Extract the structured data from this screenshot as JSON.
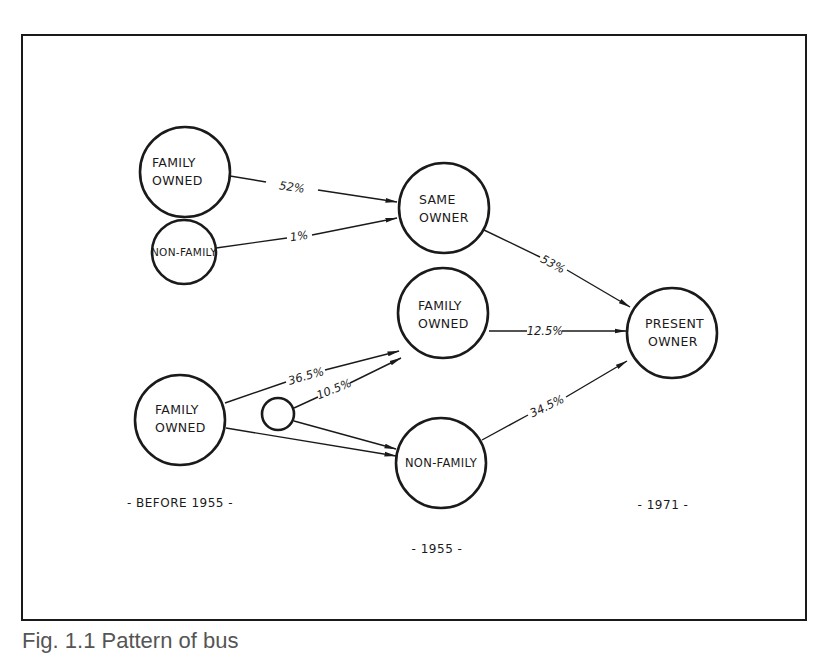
{
  "figure": {
    "caption": "Fig. 1.1 Pattern of bus",
    "frame_color": "#1a1a1a"
  },
  "nodes": {
    "before_family_owned_top": {
      "line1": "FAMILY",
      "line2": "OWNED"
    },
    "before_non_family": {
      "line1": "NON-FAMILY"
    },
    "same_owner": {
      "line1": "SAME",
      "line2": "OWNER"
    },
    "mid_family_owned": {
      "line1": "FAMILY",
      "line2": "OWNED"
    },
    "present_owner": {
      "line1": "PRESENT",
      "line2": "OWNER"
    },
    "before_family_owned_bottom": {
      "line1": "FAMILY",
      "line2": "OWNED"
    },
    "small_unlabeled": {},
    "mid_non_family": {
      "line1": "NON-FAMILY"
    }
  },
  "edges": {
    "family_to_same": "52%",
    "nonfamily_to_same": "1%",
    "same_to_present": "53%",
    "midfamily_to_present": "12.5%",
    "family_to_midfamily": "36.5%",
    "small_to_midfamily": "10.5%",
    "midnonfamily_to_present": "34.5%"
  },
  "periods": {
    "before": "- BEFORE 1955 -",
    "mid": "- 1955 -",
    "after": "- 1971 -"
  }
}
